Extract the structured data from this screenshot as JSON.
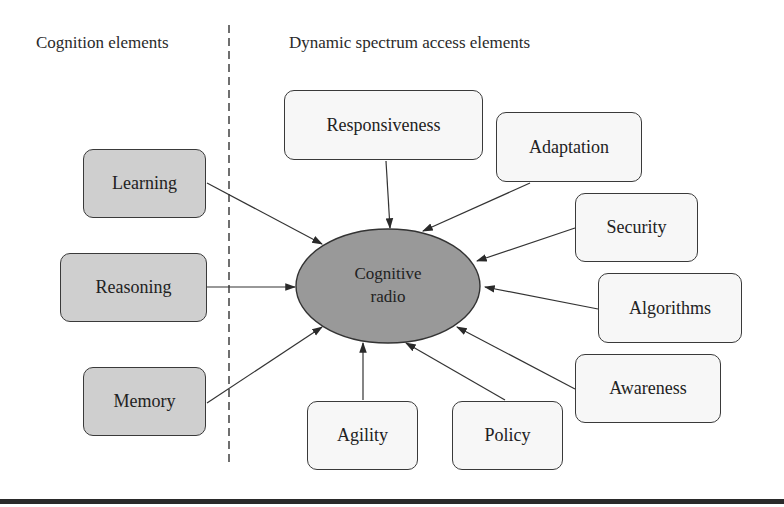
{
  "headers": {
    "left": "Cognition elements",
    "right": "Dynamic spectrum access elements"
  },
  "center": {
    "line1": "Cognitive",
    "line2": "radio",
    "fill": "#999999"
  },
  "cognition_elements": [
    {
      "label": "Learning"
    },
    {
      "label": "Reasoning"
    },
    {
      "label": "Memory"
    }
  ],
  "dsa_elements": [
    {
      "label": "Responsiveness"
    },
    {
      "label": "Adaptation"
    },
    {
      "label": "Security"
    },
    {
      "label": "Algorithms"
    },
    {
      "label": "Awareness"
    },
    {
      "label": "Policy"
    },
    {
      "label": "Agility"
    }
  ],
  "colors": {
    "cognition_box_fill": "#cfcfcf",
    "dsa_box_fill": "#f7f7f7",
    "stroke": "#3a3a3a"
  }
}
